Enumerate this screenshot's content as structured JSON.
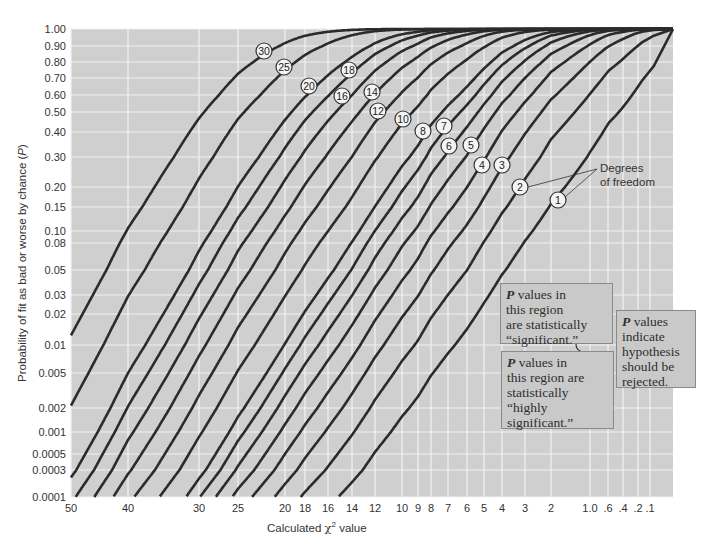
{
  "chart_data": {
    "type": "line",
    "title": "",
    "xlabel": "Calculated χ² value",
    "ylabel": "Probability of fit as bad or worse by chance (P)",
    "x_scale": "nonlinear (reversed, chi-square probability paper)",
    "y_scale": "nonlinear (probability scale)",
    "ylim": [
      0.0001,
      1.0
    ],
    "xlim": [
      50,
      0
    ],
    "grid": true,
    "x_ticks": [
      "50",
      "40",
      "30",
      "25",
      "20",
      "18",
      "16",
      "14",
      "12",
      "10",
      "9",
      "8",
      "7",
      "6",
      "5",
      "4",
      "3",
      "2",
      "1.0",
      ".6",
      ".4",
      ".2",
      ".1"
    ],
    "x_tick_values": [
      50,
      40,
      30,
      25,
      20,
      18,
      16,
      14,
      12,
      10,
      9,
      8,
      7,
      6,
      5,
      4,
      3,
      2,
      1.0,
      0.6,
      0.4,
      0.2,
      0.1
    ],
    "y_ticks": [
      "1.00",
      "0.90",
      "0.80",
      "0.70",
      "0.60",
      "0.50",
      "0.40",
      "0.30",
      "0.20",
      "0.15",
      "0.10",
      "0.08",
      "0.05",
      "0.03",
      "0.02",
      "0.01",
      "0.005",
      "0.002",
      "0.001",
      "0.0005",
      "0.0003",
      "0.0001"
    ],
    "y_tick_values": [
      1.0,
      0.9,
      0.8,
      0.7,
      0.6,
      0.5,
      0.4,
      0.3,
      0.2,
      0.15,
      0.1,
      0.08,
      0.05,
      0.03,
      0.02,
      0.01,
      0.005,
      0.002,
      0.001,
      0.0005,
      0.0003,
      0.0001
    ],
    "series": [
      {
        "name": "1",
        "df": 1
      },
      {
        "name": "2",
        "df": 2
      },
      {
        "name": "3",
        "df": 3
      },
      {
        "name": "4",
        "df": 4
      },
      {
        "name": "5",
        "df": 5
      },
      {
        "name": "6",
        "df": 6
      },
      {
        "name": "7",
        "df": 7
      },
      {
        "name": "8",
        "df": 8
      },
      {
        "name": "10",
        "df": 10
      },
      {
        "name": "12",
        "df": 12
      },
      {
        "name": "14",
        "df": 14
      },
      {
        "name": "16",
        "df": 16
      },
      {
        "name": "18",
        "df": 18
      },
      {
        "name": "20",
        "df": 20
      },
      {
        "name": "25",
        "df": 25
      },
      {
        "name": "30",
        "df": 30
      }
    ],
    "series_formula": "P = 1 - CDF_chi2(x; df)",
    "df_label_positions": [
      {
        "df": "30",
        "x": 264,
        "y": 51
      },
      {
        "df": "25",
        "x": 284,
        "y": 67
      },
      {
        "df": "20",
        "x": 309,
        "y": 86
      },
      {
        "df": "18",
        "x": 349,
        "y": 70
      },
      {
        "df": "16",
        "x": 342,
        "y": 96
      },
      {
        "df": "14",
        "x": 372,
        "y": 92
      },
      {
        "df": "12",
        "x": 378,
        "y": 111
      },
      {
        "df": "10",
        "x": 403,
        "y": 119
      },
      {
        "df": "8",
        "x": 423,
        "y": 131
      },
      {
        "df": "7",
        "x": 444,
        "y": 126
      },
      {
        "df": "6",
        "x": 449,
        "y": 146
      },
      {
        "df": "5",
        "x": 471,
        "y": 145
      },
      {
        "df": "4",
        "x": 482,
        "y": 165
      },
      {
        "df": "3",
        "x": 502,
        "y": 165
      },
      {
        "df": "2",
        "x": 520,
        "y": 187
      },
      {
        "df": "1",
        "x": 558,
        "y": 200
      }
    ],
    "annotations": [
      {
        "text": "Degrees of freedom",
        "points_to": [
          "2",
          "1"
        ]
      },
      {
        "text": "P values in this region are statistically “significant.”",
        "range": [
          0.05,
          0.01
        ]
      },
      {
        "text": "P values in this region are statistically “highly significant.”",
        "range": [
          0.01,
          0.001
        ]
      },
      {
        "text": "P values indicate hypothesis should be rejected.",
        "range": [
          0.05,
          0.001
        ]
      }
    ],
    "colors": {
      "plot_bg": "#cfcfcf",
      "grid": "#f2f2f2",
      "curve": "#2b2b2b",
      "box_bg": "#c9c9c9",
      "box_border": "#8a8a8a"
    }
  },
  "labels": {
    "ylabel_pre": "Probability of fit as bad or worse by chance (",
    "ylabel_p": "P",
    "ylabel_post": ")",
    "xlabel_pre": "Calculated ",
    "xlabel_chi": "χ",
    "xlabel_sup": "2",
    "xlabel_post": " value",
    "dof_line1": "Degrees",
    "dof_line2": "of freedom"
  },
  "boxes": {
    "significant": {
      "p": "P",
      "rest_l1": " values in",
      "l2": "this region",
      "l3": "are statistically",
      "l4": "“significant.”"
    },
    "highly": {
      "p": "P",
      "rest_l1": " values in",
      "l2": "this region are",
      "l3": "statistically",
      "l4": "“highly",
      "l5": "significant.”"
    },
    "reject": {
      "p": "P",
      "rest_l1": " values",
      "l2": "indicate",
      "l3": "hypothesis",
      "l4": "should be",
      "l5": "rejected."
    }
  }
}
